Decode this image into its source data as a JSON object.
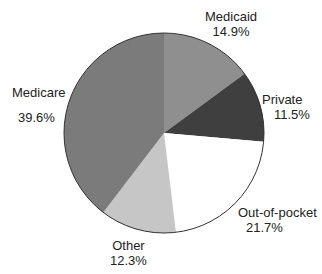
{
  "chart_data": {
    "type": "pie",
    "title": "",
    "categories": [
      "Medicaid",
      "Private",
      "Out-of-pocket",
      "Other",
      "Medicare"
    ],
    "values": [
      14.9,
      11.5,
      21.7,
      12.3,
      39.6
    ],
    "value_labels": [
      "14.9%",
      "11.5%",
      "21.7%",
      "12.3%",
      "39.6%"
    ],
    "colors": [
      "#8f8f8f",
      "#3f3f3f",
      "#ffffff",
      "#c6c6c6",
      "#7b7b7b"
    ],
    "start_angle": "12 o'clock",
    "direction": "clockwise",
    "legend": "none (direct labels)"
  },
  "labels": [
    {
      "name": "Medicaid",
      "value": "14.9%"
    },
    {
      "name": "Private",
      "value": "11.5%"
    },
    {
      "name": "Out-of-pocket",
      "value": "21.7%"
    },
    {
      "name": "Other",
      "value": "12.3%"
    },
    {
      "name": "Medicare",
      "value": "39.6%"
    }
  ]
}
